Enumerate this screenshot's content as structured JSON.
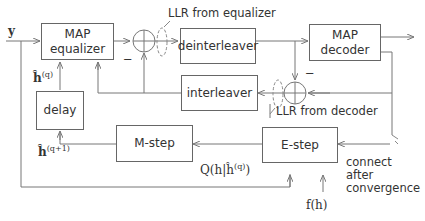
{
  "input_label": "y",
  "blocks": {
    "map_equalizer": [
      "MAP",
      "equalizer"
    ],
    "deinterleaver": "deinterleaver",
    "map_decoder": [
      "MAP",
      "decoder"
    ],
    "interleaver": "interleaver",
    "delay": "delay",
    "m_step": "M-step",
    "e_step": "E-step"
  },
  "labels": {
    "llr_equalizer": "LLR from equalizer",
    "llr_decoder": "LLR from decoder",
    "minus_top": "−",
    "minus_mid": "−",
    "connect": [
      "connect",
      "after",
      "convergence"
    ],
    "h_q": "ĥ",
    "h_q_sup": "(q)",
    "h_q1": "ĥ",
    "h_q1_sup": "(q+1)",
    "q_func": "Q(h|ĥ",
    "q_func_sup": "(q)",
    "q_func_end": ")",
    "f_h": "f(h)"
  }
}
